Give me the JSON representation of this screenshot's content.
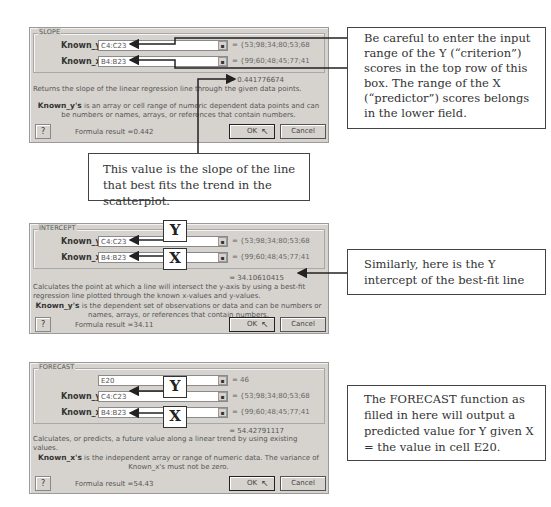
{
  "dialogs": [
    {
      "title": "SLOPE",
      "fields": [
        {
          "label": "Known_y's",
          "value": "C4:C23",
          "result": "= {53;98;34;80;53;68"
        },
        {
          "label": "Known_x's",
          "value": "B4:B23",
          "result": "= {99;60;48;45;77;41"
        }
      ],
      "formula_value": "= 0.441776674",
      "description": "Returns the slope of the linear regression line through the given data points.",
      "arg_name": "Known_y's",
      "arg_description": " is an array or cell range of numeric dependent data points and can be numbers or names, arrays, or references that contain numbers.",
      "help_label": "?",
      "formula_result": "Formula result =0.442",
      "ok_label": "OK",
      "cancel_label": "Cancel"
    },
    {
      "title": "INTERCEPT",
      "fields": [
        {
          "label": "Known_y's",
          "value": "C4:C23",
          "result": "= {53;98;34;80;53;68"
        },
        {
          "label": "Known_x's",
          "value": "B4:B23",
          "result": "= {99;60;48;45;77;41"
        }
      ],
      "formula_value": "= 34.10610415",
      "description": "Calculates the point at which a line will intersect the y-axis by using a best-fit regression line plotted through the known x-values and y-values.",
      "arg_name": "Known_y's",
      "arg_description": " is the dependent set of observations or data and can be numbers or names, arrays, or references that contain numbers.",
      "help_label": "?",
      "formula_result": "Formula result =34.11",
      "ok_label": "OK",
      "cancel_label": "Cancel"
    },
    {
      "title": "FORECAST",
      "fields": [
        {
          "label": "X",
          "value": "E20",
          "result": "= 46"
        },
        {
          "label": "Known_y's",
          "value": "C4:C23",
          "result": "= {53;98;34;80;53;68"
        },
        {
          "label": "Known_x's",
          "value": "B4:B23",
          "result": "= {99;60;48;45;77;41"
        }
      ],
      "formula_value": "= 54.42791117",
      "description": "Calculates, or predicts, a future value along a linear trend by using existing values.",
      "arg_name": "Known_x's",
      "arg_description": " is the independent array or range of numeric data. The variance of Known_x's must not be zero.",
      "help_label": "?",
      "formula_result": "Formula result =54.43",
      "ok_label": "OK",
      "cancel_label": "Cancel"
    }
  ],
  "callouts": {
    "slope_inputs": "Be careful to enter the input range of the Y (“criterion”) scores in the top row of this box. The range of the X (“predictor”) scores belongs in the lower field.",
    "slope_value": "This value is the slope of the line that best fits the trend in the scatterplot.",
    "intercept_value": "Similarly, here is the Y intercept of the best-fit line",
    "forecast": "The FORECAST function as filled in here will output a predicted value for Y given X = the value in cell E20."
  },
  "letters": {
    "y": "Y",
    "x": "X"
  },
  "icons": {
    "collapse": "collapse-dialog-icon",
    "cursor": "mouse-pointer-icon"
  }
}
